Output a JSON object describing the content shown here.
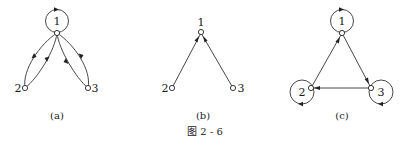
{
  "figure": {
    "caption": "图 2 - 6",
    "panels": [
      {
        "id": "a",
        "label": "(a)",
        "nodes": [
          {
            "id": "1",
            "label": "1",
            "self_loop": true
          },
          {
            "id": "2",
            "label": "2",
            "self_loop": false
          },
          {
            "id": "3",
            "label": "3",
            "self_loop": false
          }
        ],
        "edges": [
          {
            "from": "1",
            "to": "2"
          },
          {
            "from": "2",
            "to": "1"
          },
          {
            "from": "1",
            "to": "3"
          },
          {
            "from": "3",
            "to": "1"
          }
        ]
      },
      {
        "id": "b",
        "label": "(b)",
        "nodes": [
          {
            "id": "1",
            "label": "1",
            "self_loop": false
          },
          {
            "id": "2",
            "label": "2",
            "self_loop": false
          },
          {
            "id": "3",
            "label": "3",
            "self_loop": false
          }
        ],
        "edges": [
          {
            "from": "2",
            "to": "1"
          },
          {
            "from": "3",
            "to": "1"
          }
        ]
      },
      {
        "id": "c",
        "label": "(c)",
        "nodes": [
          {
            "id": "1",
            "label": "1",
            "self_loop": true
          },
          {
            "id": "2",
            "label": "2",
            "self_loop": true
          },
          {
            "id": "3",
            "label": "3",
            "self_loop": true
          }
        ],
        "edges": [
          {
            "from": "2",
            "to": "1"
          },
          {
            "from": "1",
            "to": "3"
          },
          {
            "from": "3",
            "to": "2"
          }
        ]
      }
    ]
  }
}
